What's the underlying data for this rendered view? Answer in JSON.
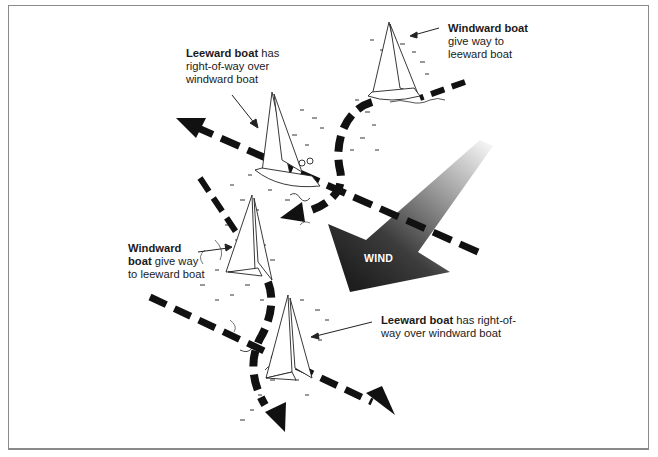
{
  "diagram": {
    "colors": {
      "background": "#ffffff",
      "frame": "#8a8a8a",
      "ink": "#111111",
      "wind_dark": "#2a2a2a",
      "wind_light": "#e8e8e8",
      "text": "#1a1a1a",
      "wind_text": "#ffffff"
    },
    "labels": [
      {
        "id": "top-right",
        "bold": "Windward boat",
        "rest_line1": "give way to",
        "rest_line2": "leeward boat"
      },
      {
        "id": "top-left",
        "bold": "Leeward boat",
        "rest_line1": " has",
        "rest_line2": "right-of-way over",
        "rest_line3": "windward boat"
      },
      {
        "id": "mid-left",
        "bold_line1": "Windward",
        "bold_line2": "boat",
        "rest_line2": " give way",
        "rest_line3": "to leeward boat"
      },
      {
        "id": "bottom-right",
        "bold": "Leeward boat",
        "rest_line1": " has right-of-",
        "rest_line2": "way over windward boat"
      }
    ],
    "wind": {
      "label": "WIND",
      "direction": "from upper-right toward lower-left"
    },
    "boats": [
      {
        "id": "boat-top-right",
        "role": "windward"
      },
      {
        "id": "boat-upper-middle",
        "role": "leeward"
      },
      {
        "id": "boat-middle-left",
        "role": "windward"
      },
      {
        "id": "boat-bottom",
        "role": "leeward"
      }
    ],
    "paths": [
      {
        "id": "course-upper-straight",
        "direction": "toward upper-left"
      },
      {
        "id": "course-upper-curved",
        "direction": "curving around to lower-left"
      },
      {
        "id": "course-lower-straight",
        "direction": "toward lower-right"
      },
      {
        "id": "course-lower-curved",
        "direction": "curving down"
      }
    ]
  }
}
